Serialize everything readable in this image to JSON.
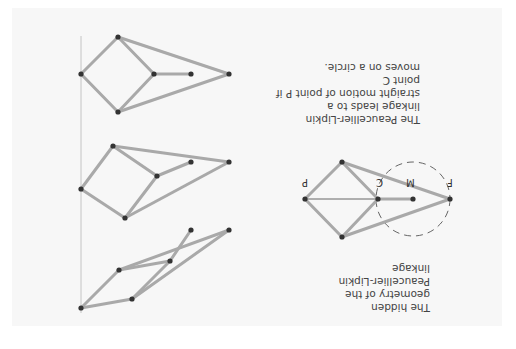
{
  "figure": {
    "orientation": "rotated-180",
    "background": "#f7f7f7",
    "link_color": "#a9a9a9",
    "joint_color": "#333333",
    "captions": {
      "main": "The Peaucellier-Lipkin linkage leads to a\nstraight motion of point P if point C\nmoves on a circle.",
      "hidden_geometry": "The hidden geometry of the\nPeaucellier-Lipkin linkage"
    },
    "labels": {
      "P": "P",
      "C": "C",
      "M": "M",
      "F": "F"
    },
    "stages": [
      {
        "name": "linkage-state-1"
      },
      {
        "name": "linkage-state-2"
      },
      {
        "name": "linkage-state-3"
      }
    ]
  }
}
